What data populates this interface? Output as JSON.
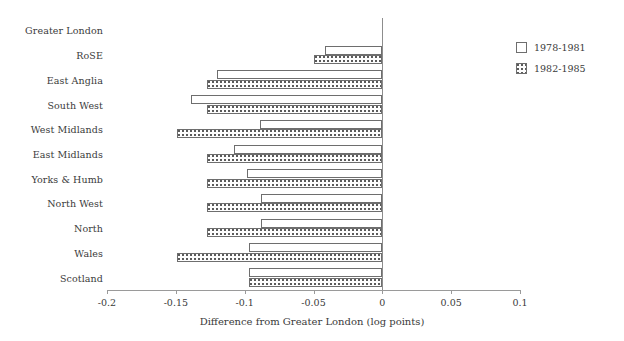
{
  "chart_data": {
    "type": "bar",
    "orientation": "horizontal",
    "title": "",
    "xlabel": "Difference from Greater London (log points)",
    "ylabel": "",
    "xlim": [
      -0.2,
      0.1
    ],
    "xticks": [
      -0.2,
      -0.15,
      -0.1,
      -0.05,
      0,
      0.05,
      0.1
    ],
    "xticklabels": [
      "-0.2",
      "-0.15",
      "-0.1",
      "-0.05",
      "0",
      "0.05",
      "0.1"
    ],
    "grid": false,
    "legend_position": "right",
    "categories": [
      "Greater London",
      "RoSE",
      "East Anglia",
      "South West",
      "West Midlands",
      "East Midlands",
      "Yorks & Humb",
      "North West",
      "North",
      "Wales",
      "Scotland"
    ],
    "series": [
      {
        "name": "1978-1981",
        "values": [
          0,
          -0.042,
          -0.12,
          -0.139,
          -0.089,
          -0.108,
          -0.098,
          -0.088,
          -0.088,
          -0.097,
          -0.097
        ]
      },
      {
        "name": "1982-1985",
        "values": [
          0,
          -0.05,
          -0.127,
          -0.127,
          -0.149,
          -0.127,
          -0.127,
          -0.127,
          -0.127,
          -0.149,
          -0.097
        ]
      }
    ]
  },
  "legend": {
    "items": [
      {
        "label": "1978-1981",
        "swatch": "white-square"
      },
      {
        "label": "1982-1985",
        "swatch": "dotted-square"
      }
    ]
  },
  "colors": {
    "axis": "#9a9a9a",
    "bar_outline": "#6e6e6e",
    "series1_fill": "#ffffff",
    "series2_fill": "#fdfdfd",
    "text": "#3a3a3a",
    "background": "#ffffff"
  }
}
